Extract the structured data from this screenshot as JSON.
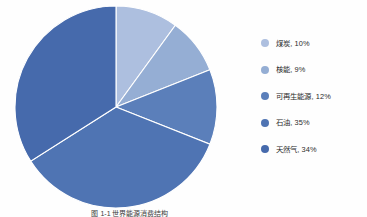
{
  "figure": {
    "background_color": "#fefefe",
    "caption": "图 1-1  世界能源消费结构"
  },
  "chart_data": {
    "type": "pie",
    "title": "",
    "xlabel": "",
    "ylabel": "",
    "grid": false,
    "legend_position": "right",
    "start_angle_deg": 0,
    "direction": "clockwise",
    "categories": [
      "煤炭",
      "核能",
      "可再生能源",
      "石油",
      "天然气"
    ],
    "values": [
      10,
      9,
      12,
      35,
      34
    ],
    "value_unit": "%",
    "colors": [
      "#adbfdf",
      "#95aed4",
      "#5b7fba",
      "#4f74b3",
      "#466aac"
    ],
    "slices": [
      {
        "label": "煤炭",
        "value": 10,
        "color": "#adbfdf",
        "legend_text": "煤炭, 10%"
      },
      {
        "label": "核能",
        "value": 9,
        "color": "#95aed4",
        "legend_text": "核能, 9%"
      },
      {
        "label": "可再生能源",
        "value": 12,
        "color": "#5b7fba",
        "legend_text": "可再生能源, 12%"
      },
      {
        "label": "石油",
        "value": 35,
        "color": "#4f74b3",
        "legend_text": "石油, 35%"
      },
      {
        "label": "天然气",
        "value": 34,
        "color": "#466aac",
        "legend_text": "天然气, 34%"
      }
    ]
  },
  "legend": {
    "items": [
      {
        "text": "煤炭, 10%",
        "color": "#adbfdf"
      },
      {
        "text": "核能, 9%",
        "color": "#95aed4"
      },
      {
        "text": "可再生能源, 12%",
        "color": "#5b7fba"
      },
      {
        "text": "石油, 35%",
        "color": "#4f74b3"
      },
      {
        "text": "天然气, 34%",
        "color": "#466aac"
      }
    ]
  }
}
